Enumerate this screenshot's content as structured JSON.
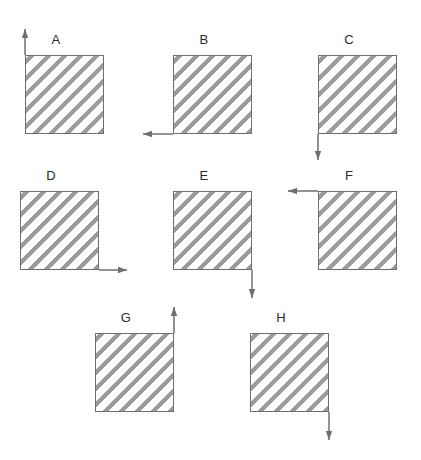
{
  "figure": {
    "background_color": "#ffffff",
    "outline_color": "#6f6f6f",
    "hatch_color": "#9c9c9c",
    "label_color": "#2b2b2b",
    "arrow_color": "#6f6f6f",
    "hatch_direction": "backslash",
    "square_size": 79,
    "shapes": [
      {
        "label": "A",
        "square_x": 25,
        "square_y": 55,
        "label_x": 56,
        "label_y": 33,
        "arrow_direction": "up",
        "arrow_origin": "top-left",
        "arrow_length": 26
      },
      {
        "label": "B",
        "square_x": 173,
        "square_y": 55,
        "label_x": 204,
        "label_y": 33,
        "arrow_direction": "left",
        "arrow_origin": "bottom-left",
        "arrow_length": 30
      },
      {
        "label": "C",
        "square_x": 318,
        "square_y": 55,
        "label_x": 349,
        "label_y": 33,
        "arrow_direction": "down",
        "arrow_origin": "bottom-left",
        "arrow_length": 26
      },
      {
        "label": "D",
        "square_x": 20,
        "square_y": 191,
        "label_x": 51,
        "label_y": 169,
        "arrow_direction": "right",
        "arrow_origin": "bottom-right",
        "arrow_length": 28
      },
      {
        "label": "E",
        "square_x": 173,
        "square_y": 191,
        "label_x": 204,
        "label_y": 169,
        "arrow_direction": "down",
        "arrow_origin": "bottom-right",
        "arrow_length": 28
      },
      {
        "label": "F",
        "square_x": 318,
        "square_y": 191,
        "label_x": 349,
        "label_y": 169,
        "arrow_direction": "left",
        "arrow_origin": "top-left",
        "arrow_length": 30
      },
      {
        "label": "G",
        "square_x": 95,
        "square_y": 333,
        "label_x": 126,
        "label_y": 311,
        "arrow_direction": "up",
        "arrow_origin": "top-right",
        "arrow_length": 26
      },
      {
        "label": "H",
        "square_x": 250,
        "square_y": 333,
        "label_x": 281,
        "label_y": 311,
        "arrow_direction": "down",
        "arrow_origin": "bottom-right",
        "arrow_length": 28
      }
    ]
  }
}
